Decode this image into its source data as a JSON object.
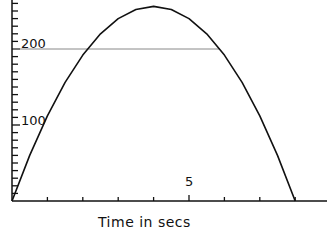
{
  "chart_data": {
    "type": "line",
    "title": "",
    "xlabel": "Time in secs",
    "ylabel": "",
    "xlim": [
      0,
      8.6
    ],
    "ylim": [
      0,
      265
    ],
    "x_ticks": [
      1,
      2,
      3,
      4,
      5,
      6,
      7,
      8
    ],
    "x_tick_labels": [
      {
        "value": 5,
        "label": "5"
      }
    ],
    "y_tick_step": 10,
    "y_tick_labels": [
      {
        "value": 100,
        "label": "100"
      },
      {
        "value": 200,
        "label": "200"
      }
    ],
    "grid": false,
    "legend": null,
    "series": [
      {
        "name": "height",
        "color": "#111111",
        "x": [
          0,
          0.5,
          1,
          1.5,
          2,
          2.5,
          3,
          3.5,
          4,
          4.5,
          5,
          5.5,
          6,
          6.5,
          7,
          7.5,
          8
        ],
        "y": [
          0,
          60,
          112,
          156,
          192,
          220,
          240,
          252,
          256,
          252,
          240,
          220,
          192,
          156,
          112,
          60,
          0
        ]
      }
    ],
    "annotations": [
      {
        "type": "hline",
        "y": 200,
        "x_from": 0,
        "x_to": 5.87,
        "color": "#888888"
      }
    ]
  },
  "labels": {
    "x_axis_title": "Time in secs",
    "y_100": "100",
    "y_200": "200",
    "x_5": "5"
  }
}
